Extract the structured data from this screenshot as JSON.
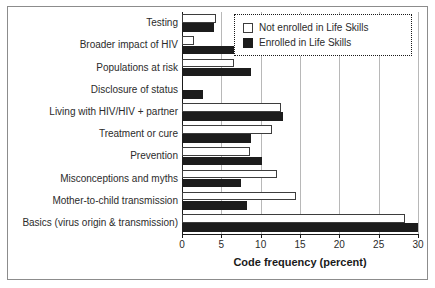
{
  "chart_data": {
    "type": "bar",
    "orientation": "horizontal",
    "title": "",
    "xlabel": "Code frequency (percent)",
    "ylabel": "",
    "xlim": [
      0,
      30
    ],
    "xticks": [
      0,
      5,
      10,
      15,
      20,
      25,
      30
    ],
    "xticklabels": [
      "0",
      "5",
      "10",
      "15",
      "20",
      "25",
      "30"
    ],
    "grid": true,
    "grid_axis": "x",
    "legend_position": "upper right",
    "categories": [
      "Testing",
      "Broader impact of HIV",
      "Populations at risk",
      "Disclosure of status",
      "Living with HIV/HIV + partner",
      "Treatment or cure",
      "Prevention",
      "Misconceptions and myths",
      "Mother-to-child transmission",
      "Basics (virus origin & transmission)"
    ],
    "series": [
      {
        "name": "Not enrolled in Life Skills",
        "color": "#ffffff",
        "edgecolor": "#3d3d3d",
        "values": [
          4.3,
          1.5,
          6.6,
          0.0,
          12.6,
          11.4,
          8.7,
          12.1,
          14.5,
          28.3
        ]
      },
      {
        "name": "Enrolled in Life Skills",
        "color": "#1c1c1c",
        "edgecolor": "#1c1c1c",
        "values": [
          4.1,
          6.9,
          8.8,
          2.7,
          12.8,
          8.8,
          10.2,
          7.5,
          8.3,
          30.0
        ]
      }
    ]
  },
  "legend": {
    "items": [
      {
        "label": "Not enrolled in Life Skills",
        "style": "light"
      },
      {
        "label": "Enrolled in Life Skills",
        "style": "dark"
      }
    ]
  }
}
